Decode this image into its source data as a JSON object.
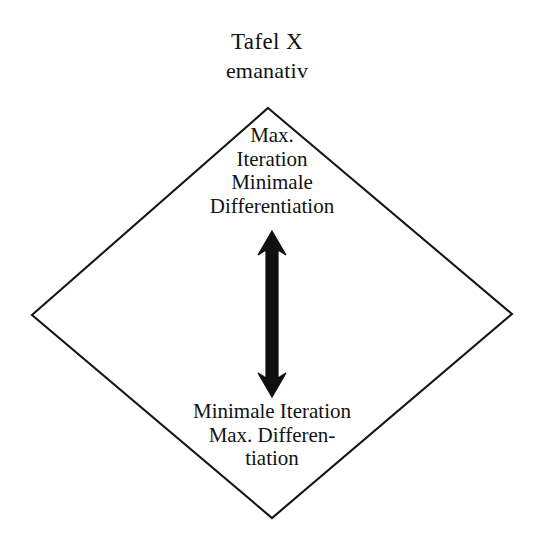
{
  "figure": {
    "heading": {
      "title": "Tafel X",
      "subtitle": "emanativ"
    },
    "shape": {
      "kind": "diamond",
      "stroke_color": "#151515",
      "fill_color": "#ffffff",
      "vertices": {
        "top": [
          268,
          108
        ],
        "right": [
          512,
          314
        ],
        "bottom": [
          272,
          518
        ],
        "left": [
          32,
          315
        ]
      }
    },
    "top_node": {
      "lines": [
        "Max.",
        "Iteration",
        "Minimale",
        "Differentiation"
      ]
    },
    "bottom_node": {
      "lines": [
        "Minimale Iteration",
        "Max. Differen-",
        "tiation"
      ]
    },
    "arrow": {
      "style": "hollow-outline-double-headed",
      "direction": "vertical-both-ways",
      "color": "#101010"
    },
    "background_color": "#ffffff"
  }
}
